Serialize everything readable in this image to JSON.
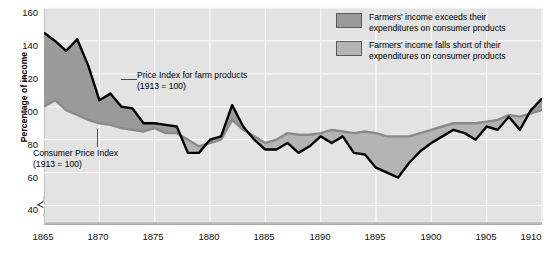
{
  "chart_data": {
    "type": "line",
    "title": "",
    "xlabel": "",
    "ylabel": "Percentage of income",
    "xlim": [
      1865,
      1910
    ],
    "ylim": [
      30,
      160
    ],
    "y_axis_break": true,
    "grid": true,
    "legend_position": "top-right",
    "y_ticks": [
      160,
      140,
      120,
      100,
      80,
      60,
      40
    ],
    "x_ticks": [
      1865,
      1870,
      1875,
      1880,
      1885,
      1890,
      1895,
      1900,
      1905,
      1910
    ],
    "x": [
      1865,
      1866,
      1867,
      1868,
      1869,
      1870,
      1871,
      1872,
      1873,
      1874,
      1875,
      1876,
      1877,
      1878,
      1879,
      1880,
      1881,
      1882,
      1883,
      1884,
      1885,
      1886,
      1887,
      1888,
      1889,
      1890,
      1891,
      1892,
      1893,
      1894,
      1895,
      1896,
      1897,
      1898,
      1899,
      1900,
      1901,
      1902,
      1903,
      1904,
      1905,
      1906,
      1907,
      1908,
      1909,
      1910
    ],
    "series": [
      {
        "name": "Price Index for farm products",
        "note": "1913 = 100",
        "color": "#000000",
        "values": [
          145,
          140,
          134,
          141,
          125,
          104,
          108,
          100,
          99,
          90,
          90,
          89,
          88,
          72,
          72,
          80,
          82,
          101,
          88,
          80,
          74,
          74,
          78,
          72,
          76,
          82,
          78,
          82,
          72,
          71,
          63,
          60,
          57,
          66,
          73,
          78,
          82,
          86,
          84,
          80,
          88,
          86,
          94,
          86,
          98,
          105
        ]
      },
      {
        "name": "Consumer Price Index",
        "note": "1913 = 100",
        "color": "#8a8a8a",
        "values": [
          100,
          104,
          98,
          95,
          92,
          90,
          89,
          87,
          86,
          85,
          87,
          84,
          84,
          80,
          76,
          78,
          80,
          92,
          86,
          82,
          78,
          80,
          84,
          83,
          83,
          84,
          86,
          85,
          84,
          85,
          84,
          82,
          82,
          82,
          84,
          86,
          88,
          90,
          90,
          90,
          91,
          92,
          95,
          94,
          96,
          98
        ]
      }
    ],
    "fill_above": {
      "label": "Farmers' income exceeds their expenditures on consumer products",
      "color": "#9a9a9a"
    },
    "fill_below": {
      "label": "Farmers' income falls short of their expenditures on consumer products",
      "color": "#b4b4b4"
    }
  },
  "axis": {
    "y_label": "Percentage of income",
    "y_ticks": [
      "160",
      "140",
      "120",
      "100",
      "80",
      "60",
      "40"
    ],
    "x_ticks": [
      "1865",
      "1870",
      "1875",
      "1880",
      "1885",
      "1890",
      "1895",
      "1900",
      "1905",
      "1910"
    ]
  },
  "annotations": {
    "farm": {
      "line1": "Price Index for farm products",
      "line2": "(1913 = 100)"
    },
    "cpi": {
      "line1": "Consumer Price Index",
      "line2": "(1913 = 100)"
    }
  },
  "legend": {
    "items": [
      {
        "line1": "Farmers' income exceeds their",
        "line2": "expenditures on consumer products",
        "color": "#9a9a9a"
      },
      {
        "line1": "Farmers' income falls short of their",
        "line2": "expenditures on consumer products",
        "color": "#b4b4b4"
      }
    ]
  }
}
